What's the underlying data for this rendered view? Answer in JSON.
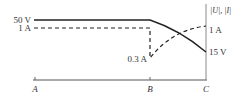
{
  "diagram": {
    "axis_label": "|U|, |I|",
    "points": [
      "A",
      "B",
      "C"
    ],
    "voltage": {
      "start_label": "50 V",
      "end_label": "15 V",
      "style": "solid"
    },
    "current": {
      "start_label": "1 A",
      "drop_label": "0.3 A",
      "end_label": "1 A",
      "style": "dashed"
    }
  }
}
